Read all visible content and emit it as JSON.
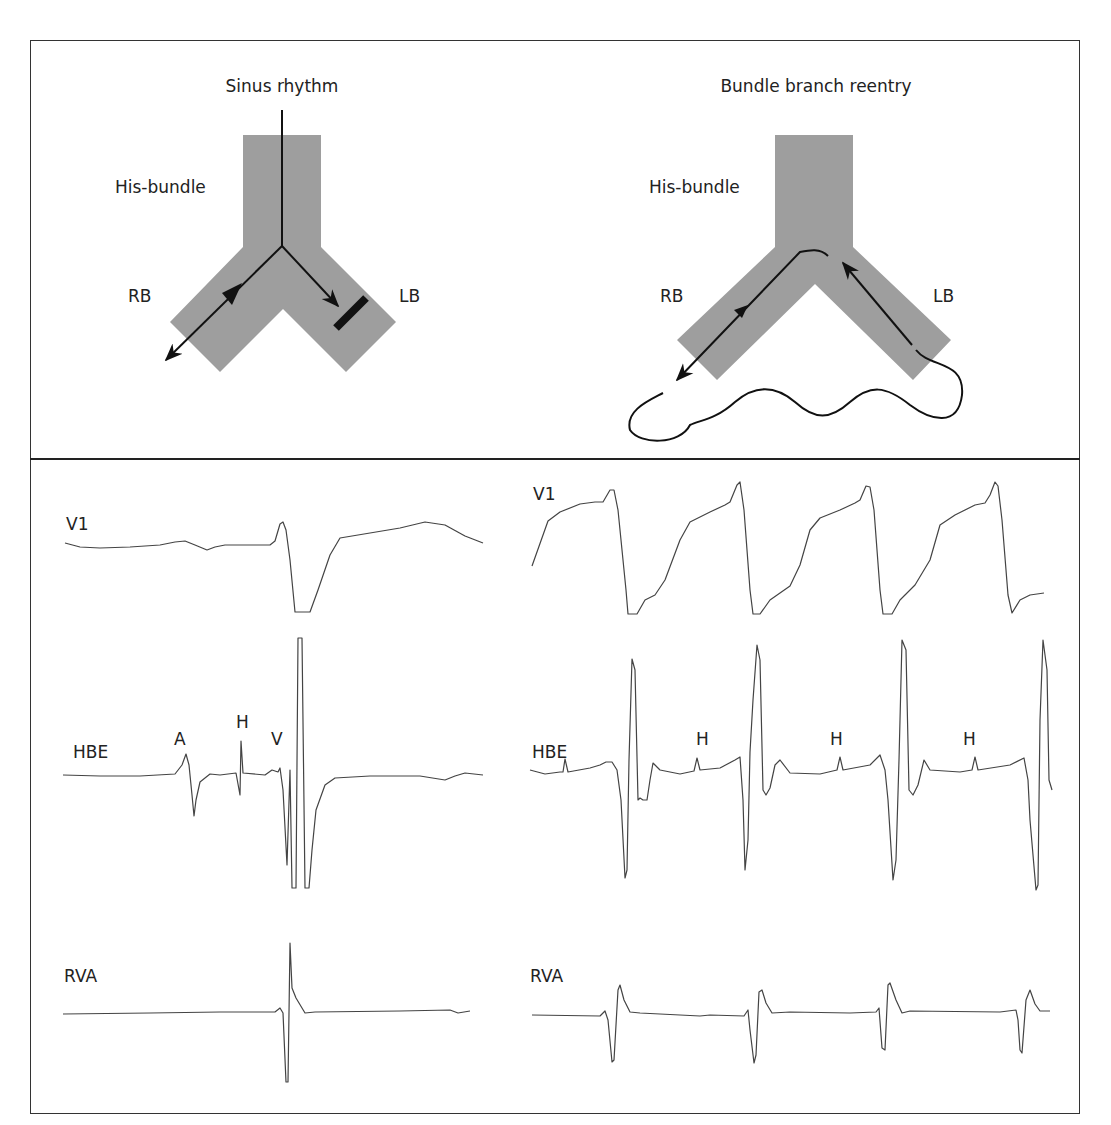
{
  "diagrams": {
    "left": {
      "title": "Sinus rhythm",
      "his_label": "His-bundle",
      "rb_label": "RB",
      "lb_label": "LB",
      "note": "Conduction down both branches; block indicated in LB"
    },
    "right": {
      "title": "Bundle branch reentry",
      "his_label": "His-bundle",
      "rb_label": "RB",
      "lb_label": "LB",
      "note": "Retrograde up LB, anterograde down RB, loop through myocardium"
    }
  },
  "colors": {
    "bundle_fill": "#9e9e9e",
    "line": "#111111",
    "trace": "#444444",
    "frame": "#333333"
  },
  "traces": {
    "left": {
      "v1_label": "V1",
      "hbe_label": "HBE",
      "rva_label": "RVA",
      "hbe_annotations": {
        "a": "A",
        "h": "H",
        "v": "V"
      }
    },
    "right": {
      "v1_label": "V1",
      "hbe_label": "HBE",
      "rva_label": "RVA",
      "hbe_annotations": {
        "h1": "H",
        "h2": "H",
        "h3": "H"
      }
    }
  }
}
